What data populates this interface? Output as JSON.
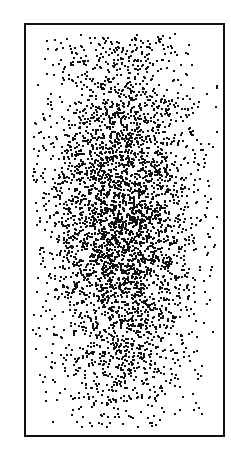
{
  "chart_data": {
    "type": "scatter",
    "title": "",
    "xlabel": "",
    "ylabel": "",
    "grid": false,
    "legend": null,
    "series": [
      {
        "name": "points",
        "distribution": "2D gaussian",
        "count": 4500,
        "center": [
          0.48,
          0.47
        ],
        "std": [
          0.19,
          0.24
        ],
        "color": "#111111",
        "marker_size": 2
      }
    ],
    "xlim": [
      0,
      1
    ],
    "ylim": [
      0,
      1
    ]
  }
}
